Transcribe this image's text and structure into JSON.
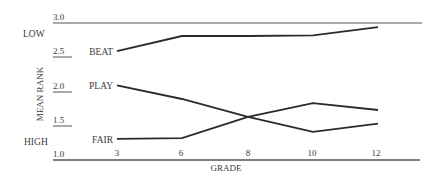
{
  "chart_data": {
    "type": "line",
    "title": "",
    "xlabel": "GRADE",
    "ylabel": "MEAN RANK",
    "x": [
      3,
      6,
      8,
      10,
      12
    ],
    "x_tick_labels": [
      "3",
      "6",
      "8",
      "10",
      "12"
    ],
    "y_tick_labels": [
      "1.0",
      "1.5",
      "2.0",
      "2.5",
      "3.0"
    ],
    "ylim": [
      1.0,
      3.0
    ],
    "y_annotations": {
      "top": "LOW",
      "bottom": "HIGH"
    },
    "grid": false,
    "legend_position": "inline labels at left of each line",
    "series": [
      {
        "name": "BEAT",
        "values": [
          2.59,
          2.81,
          2.81,
          2.82,
          2.94
        ]
      },
      {
        "name": "PLAY",
        "values": [
          2.09,
          1.89,
          1.63,
          1.41,
          1.53
        ]
      },
      {
        "name": "FAIR",
        "values": [
          1.31,
          1.32,
          1.63,
          1.83,
          1.73
        ]
      }
    ],
    "line_color": "#2a2a2a",
    "axis_color": "#555555"
  }
}
